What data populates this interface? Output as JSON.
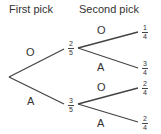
{
  "headers": {
    "first": "First pick",
    "second": "Second pick"
  },
  "first_pick": [
    {
      "label": "O",
      "prob": {
        "num": "2",
        "den": "5"
      }
    },
    {
      "label": "A",
      "prob": {
        "num": "3",
        "den": "5"
      }
    }
  ],
  "second_pick": [
    {
      "label": "O",
      "prob": {
        "num": "1",
        "den": "4"
      }
    },
    {
      "label": "A",
      "prob": {
        "num": "3",
        "den": "4"
      }
    },
    {
      "label": "O",
      "prob": {
        "num": "2",
        "den": "4"
      }
    },
    {
      "label": "A",
      "prob": {
        "num": "2",
        "den": "4"
      }
    }
  ],
  "colors": {
    "line": "#444444",
    "text": "#333333"
  }
}
